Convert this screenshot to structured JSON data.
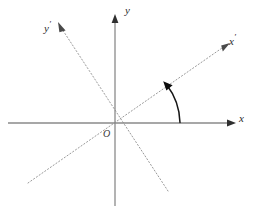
{
  "figure": {
    "background_color": "#ffffff",
    "width": 267,
    "height": 216
  },
  "colors": {
    "axis": "#8a8a8a",
    "dashed_axis": "#9a9a9a",
    "arc": "#161616",
    "label_text": "#2b2b2b",
    "origin_text": "#3a3a3a"
  },
  "labels": {
    "x_axis": "x",
    "y_axis": "y",
    "x_prime_axis_base": "x",
    "x_prime_axis_mark": "′",
    "y_prime_axis_base": "y",
    "y_prime_axis_mark": "′",
    "origin": "O"
  },
  "geometry": {
    "origin_x": 115,
    "origin_y": 123,
    "x_axis_start_x": 8,
    "x_axis_end_x": 233,
    "y_axis_top_y": 18,
    "y_axis_bottom_y": 206,
    "x_prime_angle_deg": 38,
    "y_prime_angle_deg": 128,
    "arc_radius": 63,
    "arc_from_deg": 0,
    "arc_to_deg": 38
  },
  "elements": {
    "x_axis_name": "solid horizontal axis with right arrowhead",
    "y_axis_name": "solid vertical axis with up arrowhead",
    "x_prime_axis_name": "dotted rotated axis through origin up-right",
    "y_prime_axis_name": "dotted rotated axis through origin up-left",
    "arc_name": "rotation angle arc with arrowhead"
  }
}
